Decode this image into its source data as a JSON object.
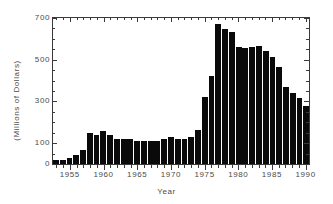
{
  "chart_data": {
    "type": "bar",
    "title": "",
    "xlabel": "Year",
    "ylabel": "(Millions of Dollars)",
    "ylim": [
      0,
      700
    ],
    "xlim": [
      1952.5,
      1990.5
    ],
    "grid": false,
    "legend": null,
    "y_ticks": [
      0,
      100,
      300,
      500,
      700
    ],
    "y_tick_labels": [
      "0",
      "100",
      "300",
      "500",
      "700"
    ],
    "y_minor_tick_interval": 50,
    "x_ticks": [
      1955,
      1960,
      1965,
      1970,
      1975,
      1980,
      1985,
      1990
    ],
    "x_tick_labels": [
      "1955",
      "1960",
      "1965",
      "1970",
      "1975",
      "1980",
      "1985",
      "1990"
    ],
    "x_minor_tick_interval": 1,
    "bar_color": "#0a0a0a",
    "axis_color": "#3a3a3a",
    "text_color": "#4a4a4a",
    "background": "#ffffff",
    "categories": [
      1953,
      1954,
      1955,
      1956,
      1957,
      1958,
      1959,
      1960,
      1961,
      1962,
      1963,
      1964,
      1965,
      1966,
      1967,
      1968,
      1969,
      1970,
      1971,
      1972,
      1973,
      1974,
      1975,
      1976,
      1977,
      1978,
      1979,
      1980,
      1981,
      1982,
      1983,
      1984,
      1985,
      1986,
      1987,
      1988,
      1989,
      1990
    ],
    "values": [
      20,
      20,
      30,
      42,
      68,
      150,
      140,
      158,
      140,
      118,
      118,
      120,
      108,
      108,
      108,
      112,
      118,
      128,
      120,
      118,
      128,
      165,
      320,
      420,
      670,
      645,
      635,
      560,
      555,
      560,
      565,
      540,
      515,
      465,
      370,
      340,
      315,
      280
    ]
  }
}
